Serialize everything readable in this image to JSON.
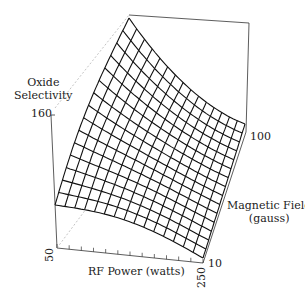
{
  "chart_data": {
    "type": "surface",
    "title": "",
    "zlabel": "Oxide Selectivity",
    "xlabel": "RF Power (watts)",
    "ylabel": "Magnetic Field (gauss)",
    "x_ticks": [
      "50",
      "250"
    ],
    "y_ticks": [
      "10",
      "100"
    ],
    "z_ticks": [
      "160"
    ],
    "xlim": [
      50,
      250
    ],
    "ylim": [
      10,
      100
    ],
    "grid_resolution": [
      15,
      15
    ]
  },
  "labels": {
    "z_line1": "Oxide",
    "z_line2": "Selectivity",
    "z_tick": "160",
    "x_title": "RF Power (watts)",
    "x_tick_min": "50",
    "x_tick_max": "250",
    "y_line1": "Magnetic Field",
    "y_line2": "(gauss)",
    "y_tick_min": "10",
    "y_tick_max": "100"
  }
}
